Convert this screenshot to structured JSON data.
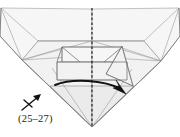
{
  "figure": {
    "name": "origami-fold-step-diagram",
    "width": 180,
    "height": 137,
    "background_color": "#ffffff",
    "caption": "(25–27)",
    "caption_meaning": "repeat steps 25 through 27",
    "paper_fill_color": "#f2f2f2",
    "paper_stroke_color": "#8d8d8d",
    "ink_color": "#111111",
    "center_line_color": "#1a1a1a"
  },
  "annotations": {
    "center_fold_line": {
      "label": "vertical-center-axis",
      "style": "dashed",
      "x": 92,
      "y_start": 8,
      "y_end": 127
    },
    "fold_arrow": {
      "label": "fold-flap-right-arrow",
      "style": "solid-curved-with-solid-head",
      "from_x": 56,
      "from_y": 86,
      "to_x": 124,
      "to_y": 93
    },
    "repeat_symbol": {
      "label": "repeat-steps-arrow",
      "x": 28,
      "y": 101,
      "tick_count": 1
    }
  },
  "shapes": {
    "outer_top_left": "0,7 38,40 92,40 92,8",
    "outer_top_right": "180,7 144,40 92,40 92,8",
    "outer_left_wing": "0,7 0,34 38,40",
    "outer_right_wing": "180,7 180,34 144,40",
    "body_left": "38,40 92,40 92,127 20,62",
    "body_right": "144,40 92,40 92,127 163,62",
    "inner_left_panel": "62,48 92,48 92,72 62,72",
    "inner_right_panel": "92,48 122,48 122,72 92,72",
    "lower_left_skirt": "56,72 92,72 92,92 52,86",
    "lower_right_skirt": "92,72 128,72 132,86 92,92",
    "left_point_tri": "20,62 38,40 62,60",
    "right_point_tri": "163,62 144,40 122,60"
  }
}
